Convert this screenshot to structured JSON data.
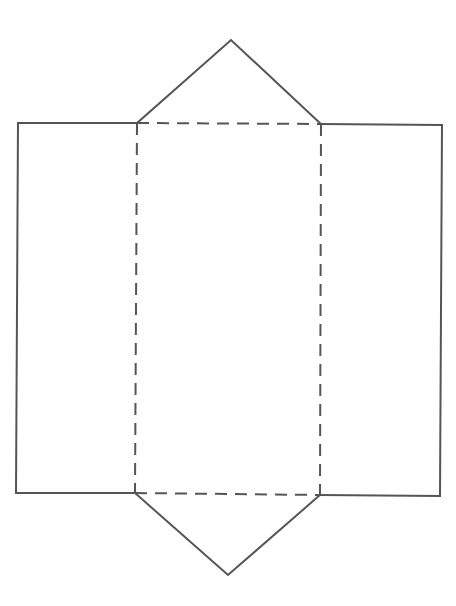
{
  "diagram": {
    "type": "net",
    "stroke_color": "#555555",
    "background_color": "#ffffff",
    "shapes": {
      "top_triangle": {
        "points": [
          [
            137,
            123
          ],
          [
            231,
            40
          ],
          [
            321,
            124
          ]
        ],
        "style": "solid"
      },
      "left_rectangle": {
        "points": [
          [
            18,
            123
          ],
          [
            137,
            123
          ],
          [
            135,
            493
          ],
          [
            16,
            493
          ]
        ],
        "style": "solid"
      },
      "right_rectangle": {
        "points": [
          [
            321,
            124
          ],
          [
            442,
            125
          ],
          [
            440,
            496
          ],
          [
            320,
            495
          ]
        ],
        "style": "solid"
      },
      "bottom_triangle": {
        "points": [
          [
            135,
            493
          ],
          [
            228,
            575
          ],
          [
            320,
            495
          ]
        ],
        "style": "solid"
      },
      "center_rectangle": {
        "points": [
          [
            137,
            123
          ],
          [
            321,
            124
          ],
          [
            320,
            495
          ],
          [
            135,
            493
          ]
        ],
        "style": "dashed"
      }
    },
    "fold_lines": [
      {
        "name": "top-fold",
        "from": [
          137,
          123
        ],
        "to": [
          321,
          124
        ]
      },
      {
        "name": "bottom-fold",
        "from": [
          135,
          493
        ],
        "to": [
          320,
          495
        ]
      },
      {
        "name": "left-fold",
        "from": [
          137,
          123
        ],
        "to": [
          135,
          493
        ]
      },
      {
        "name": "right-fold",
        "from": [
          321,
          124
        ],
        "to": [
          320,
          495
        ]
      }
    ]
  }
}
